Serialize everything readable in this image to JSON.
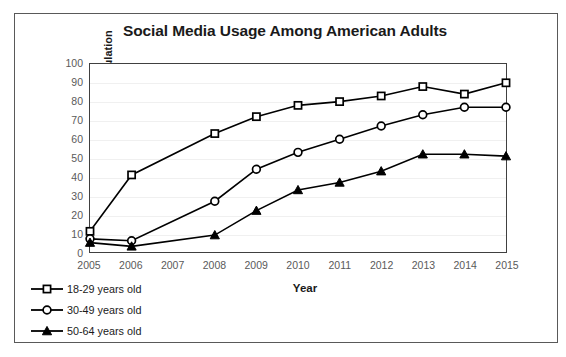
{
  "chart_data": {
    "type": "line",
    "title": "Social Media Usage Among American Adults",
    "xlabel": "Year",
    "ylabel": "Percentage of Adult Population",
    "categories": [
      "2005",
      "2006",
      "2007",
      "2008",
      "2009",
      "2010",
      "2011",
      "2012",
      "2013",
      "2014",
      "2015"
    ],
    "x": [
      2005,
      2006,
      2007,
      2008,
      2009,
      2010,
      2011,
      2012,
      2013,
      2014,
      2015
    ],
    "xlim": [
      2005,
      2015
    ],
    "ylim": [
      0,
      100
    ],
    "yticks": [
      0,
      10,
      20,
      30,
      40,
      50,
      60,
      70,
      80,
      90,
      100
    ],
    "xticks": [
      "2005",
      "2006",
      "2007",
      "2008",
      "2009",
      "2010",
      "2011",
      "2012",
      "2013",
      "2014",
      "2015"
    ],
    "grid": true,
    "legend_position": "below-left",
    "series": [
      {
        "name": "18-29 years old",
        "marker": "open-square",
        "color": "#000000",
        "values": [
          11,
          41,
          null,
          63,
          72,
          78,
          80,
          83,
          88,
          84,
          90
        ]
      },
      {
        "name": "30-49 years old",
        "marker": "open-circle",
        "color": "#000000",
        "values": [
          7,
          6,
          null,
          27,
          44,
          53,
          60,
          67,
          73,
          77,
          77
        ]
      },
      {
        "name": "50-64 years old",
        "marker": "filled-triangle",
        "color": "#000000",
        "values": [
          5,
          3,
          null,
          9,
          22,
          33,
          37,
          43,
          52,
          52,
          51
        ]
      }
    ]
  },
  "legend": {
    "items": [
      {
        "label": "18-29 years old",
        "marker": "open-square"
      },
      {
        "label": "30-49 years old",
        "marker": "open-circle"
      },
      {
        "label": "50-64 years old",
        "marker": "filled-triangle"
      }
    ]
  }
}
